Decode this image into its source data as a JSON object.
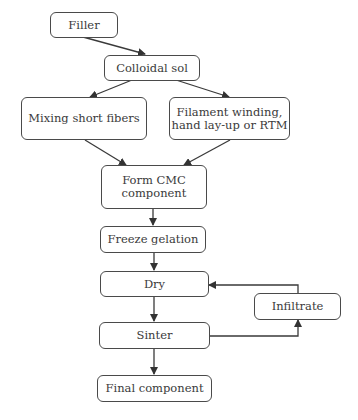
{
  "diagram": {
    "type": "flowchart",
    "nodes": [
      {
        "id": "filler",
        "label": "Filler"
      },
      {
        "id": "colloidal_sol",
        "label": "Colloidal sol"
      },
      {
        "id": "mixing",
        "label": "Mixing short fibers"
      },
      {
        "id": "filament",
        "label": "Filament winding,\nhand lay-up or RTM"
      },
      {
        "id": "form_cmc",
        "label": "Form CMC\ncomponent"
      },
      {
        "id": "freeze",
        "label": "Freeze gelation"
      },
      {
        "id": "dry",
        "label": "Dry"
      },
      {
        "id": "infiltrate",
        "label": "Infiltrate"
      },
      {
        "id": "sinter",
        "label": "Sinter"
      },
      {
        "id": "final",
        "label": "Final component"
      }
    ],
    "edges": [
      {
        "from": "filler",
        "to": "colloidal_sol"
      },
      {
        "from": "colloidal_sol",
        "to": "mixing"
      },
      {
        "from": "colloidal_sol",
        "to": "filament"
      },
      {
        "from": "mixing",
        "to": "form_cmc"
      },
      {
        "from": "filament",
        "to": "form_cmc"
      },
      {
        "from": "form_cmc",
        "to": "freeze"
      },
      {
        "from": "freeze",
        "to": "dry"
      },
      {
        "from": "dry",
        "to": "sinter"
      },
      {
        "from": "sinter",
        "to": "infiltrate"
      },
      {
        "from": "infiltrate",
        "to": "dry"
      },
      {
        "from": "sinter",
        "to": "final"
      }
    ]
  }
}
